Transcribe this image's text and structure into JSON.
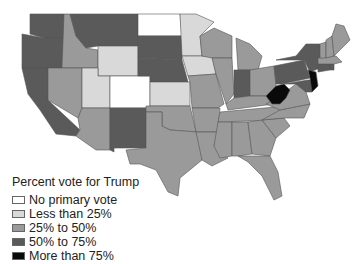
{
  "title": "Percent vote for Trump",
  "legend": {
    "title": "Percent vote for Trump",
    "items": [
      {
        "label": "No primary vote",
        "color": "#ffffff"
      },
      {
        "label": "Less than 25%",
        "color": "#d9d9d9"
      },
      {
        "label": "25% to 50%",
        "color": "#9a9a9a"
      },
      {
        "label": "50% to 75%",
        "color": "#5a5a5a"
      },
      {
        "label": "More than 75%",
        "color": "#0a0a0a"
      }
    ]
  },
  "states": {
    "WA": "50% to 75%",
    "OR": "50% to 75%",
    "CA": "50% to 75%",
    "ID": "25% to 50%",
    "NV": "25% to 50%",
    "MT": "50% to 75%",
    "WY": "Less than 25%",
    "UT": "Less than 25%",
    "AZ": "25% to 50%",
    "CO": "No primary vote",
    "NM": "50% to 75%",
    "ND": "No primary vote",
    "SD": "50% to 75%",
    "NE": "50% to 75%",
    "KS": "Less than 25%",
    "OK": "25% to 50%",
    "TX": "25% to 50%",
    "MN": "Less than 25%",
    "IA": "Less than 25%",
    "MO": "25% to 50%",
    "AR": "25% to 50%",
    "LA": "25% to 50%",
    "WI": "25% to 50%",
    "IL": "25% to 50%",
    "MI": "25% to 50%",
    "IN": "50% to 75%",
    "OH": "25% to 50%",
    "KY": "25% to 50%",
    "TN": "25% to 50%",
    "MS": "25% to 50%",
    "AL": "25% to 50%",
    "GA": "25% to 50%",
    "FL": "25% to 50%",
    "SC": "25% to 50%",
    "NC": "25% to 50%",
    "VA": "25% to 50%",
    "WV": "More than 75%",
    "PA": "50% to 75%",
    "NY": "50% to 75%",
    "NJ": "More than 75%",
    "MD": "50% to 75%",
    "DE": "50% to 75%",
    "CT": "50% to 75%",
    "RI": "50% to 75%",
    "MA": "25% to 50%",
    "VT": "25% to 50%",
    "NH": "25% to 50%",
    "ME": "25% to 50%"
  }
}
